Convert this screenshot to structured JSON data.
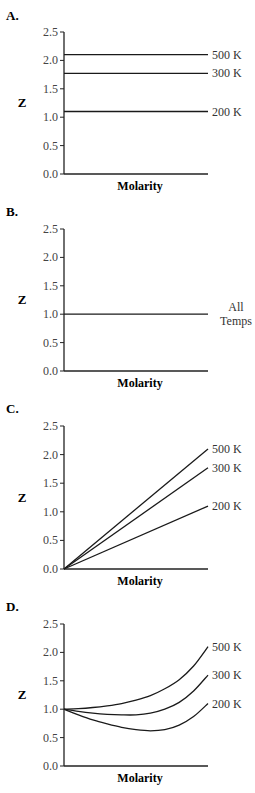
{
  "chart_data": [
    {
      "panel": "A.",
      "type": "line",
      "xlabel": "Molarity",
      "ylabel": "Z",
      "ylim": [
        0,
        2.5
      ],
      "yticks": [
        "0.0",
        "0.5",
        "1.0",
        "1.5",
        "2.0",
        "2.5"
      ],
      "grid": false,
      "x": [
        0,
        1
      ],
      "series": [
        {
          "name": "500 K",
          "values": [
            2.1,
            2.1
          ]
        },
        {
          "name": "300 K",
          "values": [
            1.77,
            1.77
          ]
        },
        {
          "name": "200 K",
          "values": [
            1.1,
            1.1
          ]
        }
      ]
    },
    {
      "panel": "B.",
      "type": "line",
      "xlabel": "Molarity",
      "ylabel": "Z",
      "ylim": [
        0,
        2.5
      ],
      "yticks": [
        "0.0",
        "0.5",
        "1.0",
        "1.5",
        "2.0",
        "2.5"
      ],
      "grid": false,
      "x": [
        0,
        1
      ],
      "series": [
        {
          "name": "All Temps",
          "values": [
            1.0,
            1.0
          ]
        }
      ]
    },
    {
      "panel": "C.",
      "type": "line",
      "xlabel": "Molarity",
      "ylabel": "Z",
      "ylim": [
        0,
        2.5
      ],
      "yticks": [
        "0.0",
        "0.5",
        "1.0",
        "1.5",
        "2.0",
        "2.5"
      ],
      "grid": false,
      "x": [
        0,
        1
      ],
      "series": [
        {
          "name": "500 K",
          "values": [
            0.0,
            2.1
          ]
        },
        {
          "name": "300 K",
          "values": [
            0.0,
            1.77
          ]
        },
        {
          "name": "200 K",
          "values": [
            0.0,
            1.1
          ]
        }
      ]
    },
    {
      "panel": "D.",
      "type": "line",
      "xlabel": "Molarity",
      "ylabel": "Z",
      "ylim": [
        0,
        2.5
      ],
      "yticks": [
        "0.0",
        "0.5",
        "1.0",
        "1.5",
        "2.0",
        "2.5"
      ],
      "grid": false,
      "x": [
        0,
        0.1,
        0.2,
        0.3,
        0.4,
        0.5,
        0.6,
        0.7,
        0.8,
        0.9,
        1.0
      ],
      "series": [
        {
          "name": "500 K",
          "values": [
            1.0,
            1.01,
            1.03,
            1.06,
            1.1,
            1.16,
            1.24,
            1.36,
            1.52,
            1.76,
            2.1
          ]
        },
        {
          "name": "300 K",
          "values": [
            1.0,
            0.96,
            0.93,
            0.91,
            0.9,
            0.9,
            0.93,
            1.0,
            1.12,
            1.32,
            1.6
          ]
        },
        {
          "name": "200 K",
          "values": [
            1.0,
            0.9,
            0.81,
            0.74,
            0.68,
            0.64,
            0.62,
            0.64,
            0.72,
            0.87,
            1.1
          ]
        }
      ]
    }
  ]
}
